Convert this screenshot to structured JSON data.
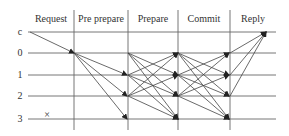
{
  "diagram": {
    "type": "sequence-protocol",
    "phases": [
      {
        "label": "Request",
        "x": 51
      },
      {
        "label": "Pre prepare",
        "x": 101
      },
      {
        "label": "Prepare",
        "x": 153
      },
      {
        "label": "Commit",
        "x": 204
      },
      {
        "label": "Reply",
        "x": 253
      }
    ],
    "rows": [
      {
        "label": "c",
        "y": 32
      },
      {
        "label": "0",
        "y": 53
      },
      {
        "label": "1",
        "y": 75
      },
      {
        "label": "2",
        "y": 96
      },
      {
        "label": "3",
        "y": 119
      }
    ],
    "faulty_marker": {
      "label": "×",
      "row": "3"
    },
    "colors": {
      "line": "#555555",
      "text": "#333333"
    }
  }
}
